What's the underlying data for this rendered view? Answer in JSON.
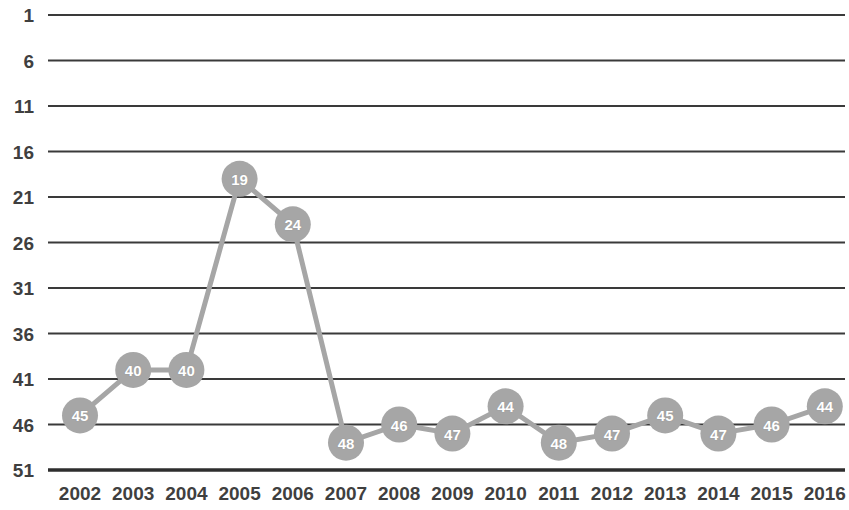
{
  "chart_data": {
    "type": "line",
    "title": "",
    "subtitle": "",
    "xlabel": "",
    "ylabel": "",
    "categories": [
      "2002",
      "2003",
      "2004",
      "2005",
      "2006",
      "2007",
      "2008",
      "2009",
      "2010",
      "2011",
      "2012",
      "2013",
      "2014",
      "2015",
      "2016"
    ],
    "values": [
      45,
      40,
      40,
      19,
      24,
      48,
      46,
      47,
      44,
      48,
      47,
      45,
      47,
      46,
      44
    ],
    "point_labels": [
      "45",
      "40",
      "40",
      "19",
      "24",
      "48",
      "46",
      "47",
      "44",
      "48",
      "47",
      "45",
      "47",
      "46",
      "44"
    ],
    "series": [
      {
        "name": "Rank",
        "values": [
          45,
          40,
          40,
          19,
          24,
          48,
          46,
          47,
          44,
          48,
          47,
          45,
          47,
          46,
          44
        ]
      }
    ],
    "y_ticks": [
      "1",
      "6",
      "11",
      "16",
      "21",
      "26",
      "31",
      "36",
      "41",
      "46",
      "51"
    ],
    "y_tick_values": [
      1,
      6,
      11,
      16,
      21,
      26,
      31,
      36,
      41,
      46,
      51
    ],
    "ylim": [
      1,
      51
    ],
    "y_axis_inverted": true,
    "grid": true,
    "grid_axis": "y",
    "legend": "none",
    "legend_position": "none",
    "marker": "circle-with-value-label",
    "annotations": []
  },
  "style": {
    "marker_color": "#a6a6a6",
    "marker_label_color": "#ffffff",
    "line_color": "#a6a6a6",
    "gridline_color": "#3a3a3a",
    "axis_line_color": "#2e2e2e",
    "tick_label_color": "#3f3f3f",
    "background_color": "#ffffff"
  },
  "geometry": {
    "plot_left": 48,
    "plot_right": 845,
    "first_point_x": 80,
    "point_spacing": 53.2,
    "grid_top_y": 15,
    "grid_spacing_y": 45.5,
    "marker_radius": 18,
    "line_width": 5,
    "gridline_width": 2.2,
    "axis_line_width": 3.4
  }
}
